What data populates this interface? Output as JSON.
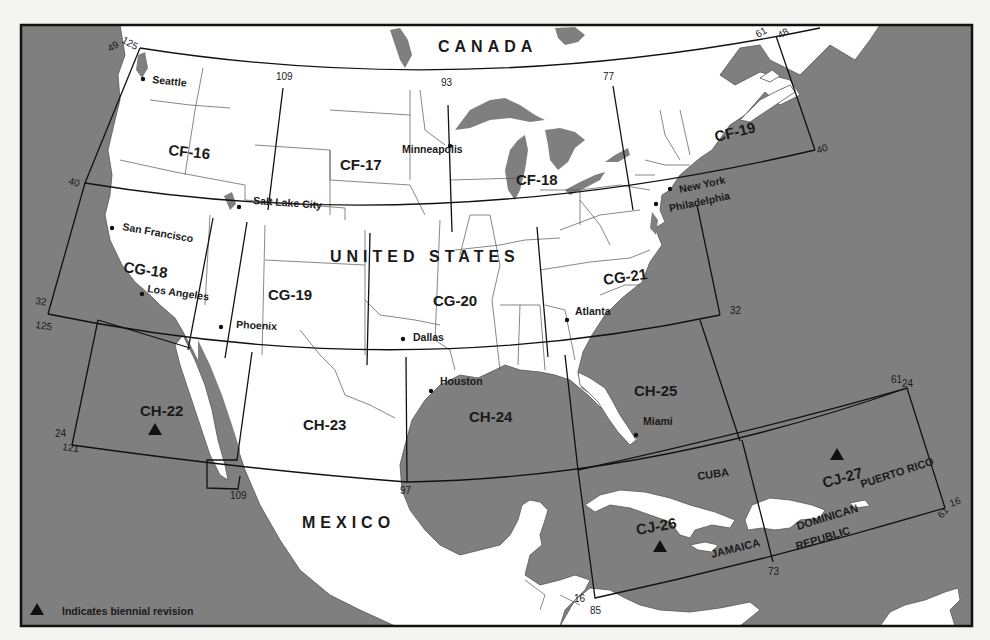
{
  "map": {
    "countries": {
      "canada": "CANADA",
      "united_states": "UNITED STATES",
      "mexico": "MEXICO"
    },
    "charts": [
      {
        "id": "CF-16",
        "row": "CF",
        "biennial": false
      },
      {
        "id": "CF-17",
        "row": "CF",
        "biennial": false
      },
      {
        "id": "CF-18",
        "row": "CF",
        "biennial": false
      },
      {
        "id": "CF-19",
        "row": "CF",
        "biennial": false
      },
      {
        "id": "CG-18",
        "row": "CG",
        "biennial": false
      },
      {
        "id": "CG-19",
        "row": "CG",
        "biennial": false
      },
      {
        "id": "CG-20",
        "row": "CG",
        "biennial": false
      },
      {
        "id": "CG-21",
        "row": "CG",
        "biennial": false
      },
      {
        "id": "CH-22",
        "row": "CH",
        "biennial": true
      },
      {
        "id": "CH-23",
        "row": "CH",
        "biennial": false
      },
      {
        "id": "CH-24",
        "row": "CH",
        "biennial": false
      },
      {
        "id": "CH-25",
        "row": "CH",
        "biennial": false
      },
      {
        "id": "CJ-26",
        "row": "CJ",
        "biennial": true
      },
      {
        "id": "CJ-27",
        "row": "CJ",
        "biennial": true
      }
    ],
    "cities": [
      "Seattle",
      "Salt Lake City",
      "San Francisco",
      "Los Angeles",
      "Phoenix",
      "Minneapolis",
      "Dallas",
      "Houston",
      "Atlanta",
      "Miami",
      "New York",
      "Philadelphia"
    ],
    "islands": {
      "cuba": "CUBA",
      "jamaica": "JAMAICA",
      "puerto_rico": "PUERTO RICO",
      "dominican": "DOMINICAN",
      "republic": "REPUBLIC"
    },
    "coordinates": {
      "nw_lat": "49",
      "nw_lon": "125",
      "lon_109_top": "109",
      "lon_93": "93",
      "lon_77": "77",
      "ne_lon": "61",
      "ne_lat": "48",
      "lat_40_west": "40",
      "lat_40_east": "40",
      "lat_32_west": "32",
      "lon_125_west": "125",
      "lat_32_east": "32",
      "lat_24_west": "24",
      "lon_121": "121",
      "lon_109_bottom": "109",
      "lon_97": "97",
      "cj_ne_lon": "61",
      "cj_ne_lat": "24",
      "cj_se_lat": "16",
      "cj_se_lon": "61",
      "cj_sw_lat": "16",
      "cj_sw_lon": "85",
      "lon_73": "73"
    },
    "colors": {
      "water": "#7f7f7f",
      "land": "#ffffff",
      "grid": "#111111"
    }
  },
  "legend": {
    "icon": "triangle-icon",
    "text": "Indicates biennial revision"
  }
}
